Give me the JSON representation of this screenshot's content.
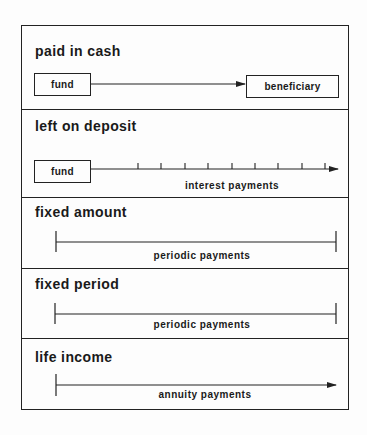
{
  "sections": [
    {
      "title": "paid in cash",
      "source_box": "fund",
      "target_box": "beneficiary"
    },
    {
      "title": "left on deposit",
      "source_box": "fund",
      "line_label": "interest payments",
      "tick_count": 9
    },
    {
      "title": "fixed amount",
      "line_label": "periodic payments"
    },
    {
      "title": "fixed period",
      "line_label": "periodic payments"
    },
    {
      "title": "life income",
      "line_label": "annuity payments"
    }
  ],
  "colors": {
    "line": "#222222",
    "background": "#fdfdfd"
  }
}
